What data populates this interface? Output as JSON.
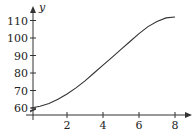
{
  "chart_data": {
    "type": "line",
    "title": "",
    "xlabel": "",
    "ylabel": "y",
    "x_ticks": [
      2,
      4,
      6,
      8
    ],
    "y_ticks": [
      60,
      70,
      80,
      90,
      100,
      110
    ],
    "xlim": [
      0,
      8.8
    ],
    "ylim": [
      56,
      118
    ],
    "y_axis_break": true,
    "grid": false,
    "legend": null,
    "series": [
      {
        "name": "y",
        "x": [
          0,
          0.5,
          1,
          1.5,
          2,
          2.5,
          3,
          3.5,
          4,
          4.5,
          5,
          5.5,
          6,
          6.5,
          7,
          7.5,
          8
        ],
        "y": [
          60,
          61,
          62.5,
          65,
          68,
          71.5,
          75.5,
          80,
          84.5,
          89,
          93.5,
          98,
          102.5,
          106.5,
          109.5,
          111.5,
          112
        ]
      }
    ]
  },
  "labels": {
    "y_axis": "y",
    "x_ticks": [
      "2",
      "4",
      "6",
      "8"
    ],
    "y_ticks": [
      "60",
      "70",
      "80",
      "90",
      "100",
      "110"
    ]
  },
  "colors": {
    "axis": "#333333",
    "curve": "#333333"
  }
}
